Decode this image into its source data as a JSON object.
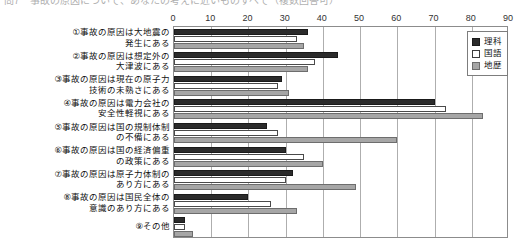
{
  "title": "問7　事故の原因について、あなたの考えに近いものすべて（複数回答可）",
  "chart_data": {
    "type": "bar",
    "orientation": "horizontal",
    "title": "問7　事故の原因について、あなたの考えに近いものすべて（複数回答可）",
    "xlabel": "",
    "ylabel": "",
    "xlim": [
      0,
      90
    ],
    "xticks": [
      0,
      10,
      20,
      30,
      40,
      50,
      60,
      70,
      80,
      90
    ],
    "grid": true,
    "legend_position": "top-right",
    "categories": [
      "①事故の原因は大地震の\n発生にある",
      "②事故の原因は想定外の\n大津波にある",
      "③事故の原因は現在の原子力\n技術の未熟さにある",
      "④事故の原因は電力会社の\n安全性軽視にある",
      "⑤事故の原因は国の規制体制\nの不備にある",
      "⑥事故の原因は国の経済偏重\nの政策にある",
      "⑦事故の原因は原子力体制の\nあり方にある",
      "⑧事故の原因は国民全体の\n意識のあり方にある",
      "⑨その他"
    ],
    "series": [
      {
        "name": "理科",
        "color": "#2b2b2b",
        "values": [
          36,
          44,
          29,
          70,
          25,
          30,
          32,
          20,
          3
        ]
      },
      {
        "name": "国語",
        "color": "#ffffff",
        "values": [
          33,
          38,
          28,
          73,
          28,
          35,
          30,
          26,
          3
        ]
      },
      {
        "name": "地歴",
        "color": "#a6a6a6",
        "values": [
          35,
          36,
          31,
          83,
          60,
          40,
          49,
          33,
          5
        ]
      }
    ]
  },
  "legend": {
    "items": [
      {
        "label": "理科",
        "key": "rika"
      },
      {
        "label": "国語",
        "key": "kokugo"
      },
      {
        "label": "地歴",
        "key": "chireki"
      }
    ]
  }
}
